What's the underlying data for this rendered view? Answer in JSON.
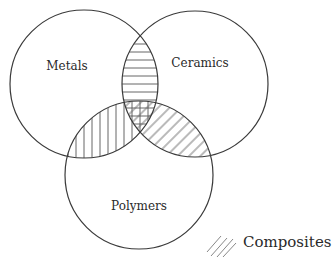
{
  "diagram": {
    "type": "venn",
    "sets": [
      {
        "id": "metals",
        "label": "Metals"
      },
      {
        "id": "ceramics",
        "label": "Ceramics"
      },
      {
        "id": "polymers",
        "label": "Polymers"
      }
    ],
    "intersections": [
      {
        "sets": [
          "metals",
          "ceramics"
        ],
        "pattern": "horizontal-hatch"
      },
      {
        "sets": [
          "metals",
          "polymers"
        ],
        "pattern": "vertical-hatch"
      },
      {
        "sets": [
          "ceramics",
          "polymers"
        ],
        "pattern": "diagonal-hatch"
      },
      {
        "sets": [
          "metals",
          "ceramics",
          "polymers"
        ],
        "pattern": "cross-hatch"
      }
    ],
    "legend": {
      "label": "Composites",
      "pattern": "diagonal-hatch"
    }
  },
  "colors": {
    "stroke": "#3a3a3a",
    "hatch": "#555555",
    "background": "#ffffff"
  }
}
